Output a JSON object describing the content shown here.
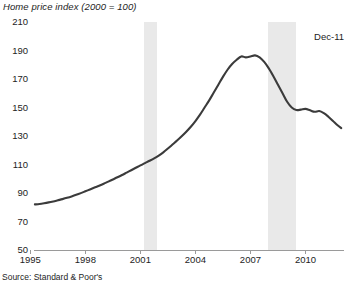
{
  "chart_data": {
    "type": "line",
    "title": "Home price index (2000 = 100)",
    "xlabel": "",
    "ylabel": "",
    "ylim": [
      50,
      210
    ],
    "xlim": [
      1995.2,
      2012.1
    ],
    "ytick_labels": [
      "210",
      "190",
      "170",
      "150",
      "130",
      "110",
      "90",
      "70",
      "50"
    ],
    "ytick_values": [
      210,
      190,
      170,
      150,
      130,
      110,
      90,
      70,
      50
    ],
    "xtick_labels": [
      "1995",
      "1998",
      "2001",
      "2004",
      "2007",
      "2010"
    ],
    "xtick_values": [
      1995,
      1998,
      2001,
      2004,
      2007,
      2010
    ],
    "grid": false,
    "legend": false,
    "line_color": "#3b3b3b",
    "band_color": "#e9e9e9",
    "series": [
      {
        "name": "Home price index",
        "x": [
          1995.25,
          1995.5,
          1995.75,
          1996.0,
          1996.25,
          1996.5,
          1996.75,
          1997.0,
          1997.25,
          1997.5,
          1997.75,
          1998.0,
          1998.25,
          1998.5,
          1998.75,
          1999.0,
          1999.25,
          1999.5,
          1999.75,
          2000.0,
          2000.25,
          2000.5,
          2000.75,
          2001.0,
          2001.25,
          2001.5,
          2001.75,
          2002.0,
          2002.25,
          2002.5,
          2002.75,
          2003.0,
          2003.25,
          2003.5,
          2003.75,
          2004.0,
          2004.25,
          2004.5,
          2004.75,
          2005.0,
          2005.25,
          2005.5,
          2005.75,
          2006.0,
          2006.25,
          2006.5,
          2006.75,
          2007.0,
          2007.25,
          2007.5,
          2007.75,
          2008.0,
          2008.25,
          2008.5,
          2008.75,
          2009.0,
          2009.25,
          2009.5,
          2009.75,
          2010.0,
          2010.25,
          2010.5,
          2010.75,
          2011.0,
          2011.25,
          2011.5,
          2011.75,
          2011.95
        ],
        "values": [
          82,
          82.3,
          82.8,
          83.4,
          84.1,
          84.9,
          85.7,
          86.6,
          87.6,
          88.7,
          89.9,
          91.2,
          92.5,
          93.8,
          95.1,
          96.5,
          98.0,
          99.5,
          101.0,
          102.6,
          104.3,
          106.0,
          107.7,
          109.4,
          111.0,
          112.6,
          114.3,
          116.2,
          118.5,
          121.2,
          124.0,
          126.8,
          129.8,
          133.0,
          136.5,
          140.5,
          145.0,
          150.0,
          155.0,
          160.5,
          166.0,
          171.5,
          176.5,
          180.5,
          183.5,
          185.8,
          185.2,
          185.8,
          186.6,
          185.2,
          182.0,
          177.5,
          172.0,
          166.0,
          160.0,
          154.0,
          150.0,
          148.2,
          148.5,
          149.0,
          148.0,
          147.0,
          147.5,
          146.0,
          143.5,
          140.5,
          137.5,
          135.5
        ]
      }
    ],
    "annotations": [
      {
        "id": "last-point-label",
        "text": "Dec-11"
      }
    ],
    "shaded_regions": [
      {
        "id": "recession-2001",
        "start": 2001.2,
        "end": 2001.9
      },
      {
        "id": "recession-2008",
        "start": 2007.95,
        "end": 2009.5
      }
    ],
    "source": "Source: Standard & Poor's"
  }
}
